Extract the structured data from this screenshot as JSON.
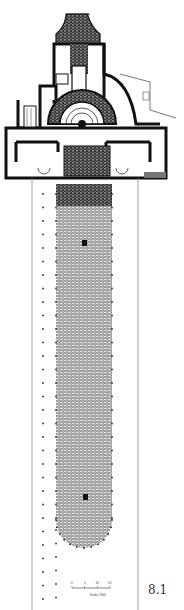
{
  "figure": {
    "number": "8.1",
    "scale_bar": {
      "ticks": [
        "0",
        "5",
        "10",
        "15"
      ],
      "caption": "Scale 1:800"
    },
    "colors": {
      "wall": "#111111",
      "hatch": "#555555",
      "court_fill": "#8a8a8a",
      "paper": "#ffffff"
    }
  }
}
